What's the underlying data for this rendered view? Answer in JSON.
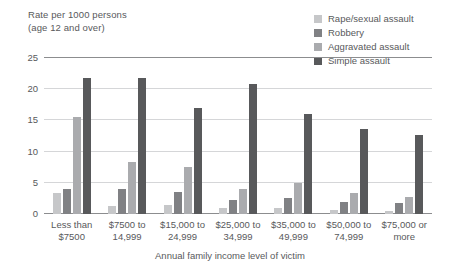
{
  "chart_data": {
    "type": "bar",
    "title": "",
    "ylabel_lines": [
      "Rate per 1000 persons",
      "(age 12 and over)"
    ],
    "xlabel": "Annual family income level of victim",
    "ylim": [
      0,
      25
    ],
    "yticks": [
      0,
      5,
      10,
      15,
      20,
      25
    ],
    "grid": true,
    "legend_position": "top-right",
    "categories": [
      [
        "Less than",
        "$7500"
      ],
      [
        "$7500 to",
        "14,999"
      ],
      [
        "$15,000 to",
        "24,999"
      ],
      [
        "$25,000 to",
        "34,999"
      ],
      [
        "$35,000 to",
        "49,999"
      ],
      [
        "$50,000 to",
        "74,999"
      ],
      [
        "$75,000 or",
        "more"
      ]
    ],
    "category_labels": [
      "Less than $7500",
      "$7500 to 14,999",
      "$15,000 to 24,999",
      "$25,000 to 34,999",
      "$35,000 to 49,999",
      "$50,000 to 74,999",
      "$75,000 or more"
    ],
    "series": [
      {
        "name": "Rape/sexual assault",
        "color": "#c6c7c9",
        "values": [
          3.4,
          1.3,
          1.5,
          1.0,
          0.9,
          0.7,
          0.5
        ]
      },
      {
        "name": "Robbery",
        "color": "#808184",
        "values": [
          4.0,
          4.0,
          3.5,
          2.3,
          2.5,
          2.0,
          1.7
        ]
      },
      {
        "name": "Aggravated assault",
        "color": "#aaabae",
        "values": [
          15.6,
          8.3,
          7.5,
          4.0,
          5.0,
          3.3,
          2.8
        ]
      },
      {
        "name": "Simple assault",
        "color": "#58595b",
        "values": [
          21.8,
          21.8,
          17.0,
          20.8,
          16.0,
          13.7,
          12.7
        ]
      }
    ]
  }
}
